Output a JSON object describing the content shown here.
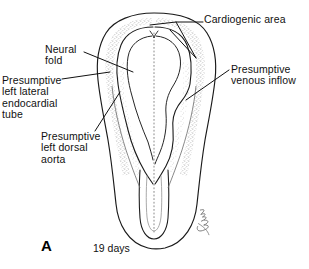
{
  "figure": {
    "panel_letter": "A",
    "caption": "19 days",
    "stroke_color": "#1a1a1a",
    "stipple_color": "#8a8a8a",
    "background": "#ffffff"
  },
  "labels": {
    "cardiogenic_area": "Cardiogenic area",
    "neural_fold": "Neural\nfold",
    "presumptive_left_lateral_endocardial_tube": "Presumptive\nleft lateral\nendocardial\ntube",
    "presumptive_venous_inflow": "Presumptive\nvenous inflow",
    "presumptive_left_dorsal_aorta": "Presumptive\nleft dorsal\naorta"
  },
  "artist_signature": "Macy"
}
